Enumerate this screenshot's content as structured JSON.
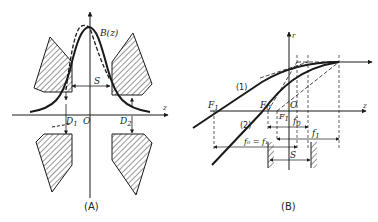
{
  "figure": {
    "panels": [
      {
        "id": "A",
        "caption": "(A)",
        "labels": {
          "curve": "B(z)",
          "gap": "S",
          "axis_z": "z",
          "origin": "O",
          "d1": "D",
          "d1_sub": "1",
          "d2": "D",
          "d2_sub": "2"
        }
      },
      {
        "id": "B",
        "caption": "(B)",
        "labels": {
          "axis_r": "r",
          "axis_z": "z",
          "ray1": "(1)",
          "ray2": "(2)",
          "f1_point": "F",
          "f1_point_sub": "1",
          "f0_point": "F",
          "f0_point_sub": "0",
          "origin": "O",
          "f1_small": "F",
          "f1_small_sub": "1",
          "f0_dist": "f",
          "f0_dist_sub": "0",
          "f1_dist": "f",
          "f1_dist_sub": "1",
          "f0_eq_f1": "f₀ = f₁",
          "gap": "S"
        }
      }
    ]
  },
  "colors": {
    "line": "#1a1a1a",
    "hatch": "#333333",
    "background": "#ffffff"
  }
}
